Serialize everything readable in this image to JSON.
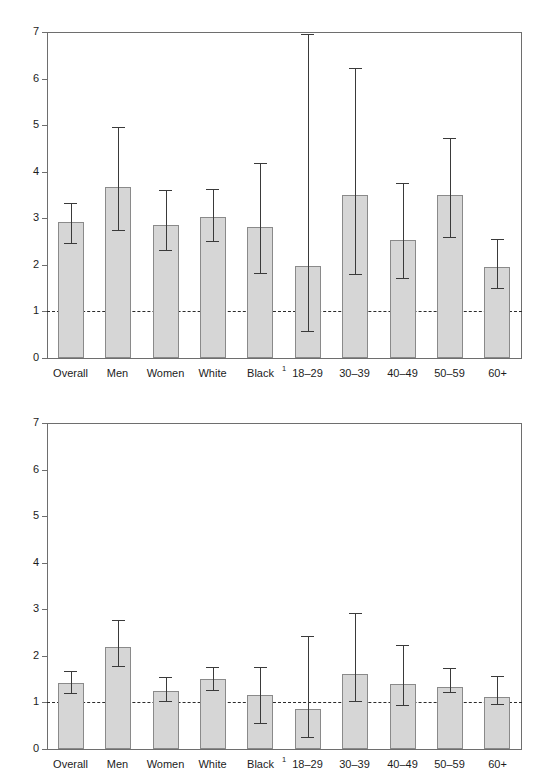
{
  "figure": {
    "background": "#ffffff",
    "bar_fill": "#d6d6d6",
    "bar_stroke": "#8a8a8a",
    "axis_color": "#6e6e6e",
    "error_color": "#3a3a3a",
    "reference_label": "1",
    "footnote_marker": "1"
  },
  "categories": [
    "Overall",
    "Men",
    "Women",
    "White",
    "Black",
    "18–29",
    "30–39",
    "40–49",
    "50–59",
    "60+"
  ],
  "ytick_labels": [
    "0",
    "1",
    "2",
    "3",
    "4",
    "5",
    "6",
    "7"
  ],
  "chart_data": [
    {
      "type": "bar",
      "id": "panel-top",
      "title": "",
      "subtitle": "",
      "xlabel": "",
      "ylabel": "",
      "ylim": [
        0,
        7
      ],
      "yticks": [
        0,
        1,
        2,
        3,
        4,
        5,
        6,
        7
      ],
      "grid": false,
      "legend": "none",
      "reference_line": {
        "y": 1,
        "style": "dashed"
      },
      "categories": [
        "Overall",
        "Men",
        "Women",
        "White",
        "Black",
        "18–29",
        "30–39",
        "40–49",
        "50–59",
        "60+"
      ],
      "values": [
        2.92,
        3.68,
        2.85,
        3.02,
        2.82,
        1.98,
        3.5,
        2.53,
        3.51,
        1.96
      ],
      "ci_low": [
        2.48,
        2.75,
        2.32,
        2.51,
        1.82,
        0.57,
        1.8,
        1.71,
        2.59,
        1.5
      ],
      "ci_high": [
        3.33,
        4.96,
        3.61,
        3.62,
        4.19,
        6.96,
        6.22,
        3.76,
        4.72,
        2.55
      ],
      "annotations": [
        "Black has footnote marker 1"
      ]
    },
    {
      "type": "bar",
      "id": "panel-bottom",
      "title": "",
      "subtitle": "",
      "xlabel": "",
      "ylabel": "",
      "ylim": [
        0,
        7
      ],
      "yticks": [
        0,
        1,
        2,
        3,
        4,
        5,
        6,
        7
      ],
      "grid": false,
      "legend": "none",
      "reference_line": {
        "y": 1,
        "style": "dashed"
      },
      "categories": [
        "Overall",
        "Men",
        "Women",
        "White",
        "Black",
        "18–29",
        "30–39",
        "40–49",
        "50–59",
        "60+"
      ],
      "values": [
        1.42,
        2.18,
        1.25,
        1.51,
        1.16,
        0.85,
        1.61,
        1.39,
        1.34,
        1.12
      ],
      "ci_low": [
        1.21,
        1.78,
        1.02,
        1.26,
        0.55,
        0.25,
        1.03,
        0.95,
        1.22,
        0.96
      ],
      "ci_high": [
        1.68,
        2.76,
        1.55,
        1.76,
        1.77,
        2.42,
        2.92,
        2.23,
        1.73,
        1.57
      ],
      "annotations": [
        "Black has footnote marker 1"
      ]
    }
  ]
}
